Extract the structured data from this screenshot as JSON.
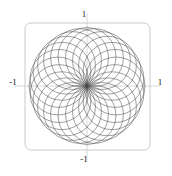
{
  "figure": {
    "name": "rose-circle-family-plot",
    "background_color": "#ffffff",
    "frame": {
      "color": "#bdbdbd",
      "stroke_width": 0.8,
      "corner_radius": 6,
      "x": 25,
      "y": 23,
      "width": 125,
      "height": 127
    },
    "axes": {
      "color": "#c9c9c9",
      "stroke_width": 0.7,
      "origin_px": {
        "x": 87,
        "y": 86
      },
      "x_axis_y_px": 86,
      "y_axis_x_px": 87
    },
    "curve": {
      "color": "#4a4a4a",
      "stroke_width": 0.55,
      "opacity": 0.95
    }
  },
  "ticks": {
    "top": "1",
    "bottom": "-1",
    "left": "-1",
    "right": "1"
  },
  "chart_data": {
    "type": "line",
    "title": "",
    "subtitle": "",
    "xlabel": "",
    "ylabel": "",
    "grid": false,
    "legend": "none",
    "xlim": [
      -1.08,
      1.08
    ],
    "ylim": [
      -1.08,
      1.08
    ],
    "xticks": [
      -1,
      1
    ],
    "yticks": [
      -1,
      1
    ],
    "xtick_labels": [
      "-1",
      "1"
    ],
    "ytick_labels": [
      "-1",
      "1"
    ],
    "aspect_ratio": 1,
    "parametric": {
      "family_count": 24,
      "circle_radius": 0.5,
      "center_orbit_radius": 0.5,
      "angle_step_deg": 15,
      "formula_x": "0.5*cos(k*15deg) + 0.5*cos(t)",
      "formula_y": "0.5*sin(k*15deg) + 0.5*sin(t)",
      "t_range_deg": [
        0,
        360
      ],
      "k_range": [
        0,
        23
      ]
    },
    "series": [
      {
        "name": "circle-00",
        "center_angle_deg": 0,
        "center": [
          0.5,
          0.0
        ],
        "radius": 0.5
      },
      {
        "name": "circle-01",
        "center_angle_deg": 15,
        "center": [
          0.483,
          0.129
        ],
        "radius": 0.5
      },
      {
        "name": "circle-02",
        "center_angle_deg": 30,
        "center": [
          0.433,
          0.25
        ],
        "radius": 0.5
      },
      {
        "name": "circle-03",
        "center_angle_deg": 45,
        "center": [
          0.354,
          0.354
        ],
        "radius": 0.5
      },
      {
        "name": "circle-04",
        "center_angle_deg": 60,
        "center": [
          0.25,
          0.433
        ],
        "radius": 0.5
      },
      {
        "name": "circle-05",
        "center_angle_deg": 75,
        "center": [
          0.129,
          0.483
        ],
        "radius": 0.5
      },
      {
        "name": "circle-06",
        "center_angle_deg": 90,
        "center": [
          0.0,
          0.5
        ],
        "radius": 0.5
      },
      {
        "name": "circle-07",
        "center_angle_deg": 105,
        "center": [
          -0.129,
          0.483
        ],
        "radius": 0.5
      },
      {
        "name": "circle-08",
        "center_angle_deg": 120,
        "center": [
          -0.25,
          0.433
        ],
        "radius": 0.5
      },
      {
        "name": "circle-09",
        "center_angle_deg": 135,
        "center": [
          -0.354,
          0.354
        ],
        "radius": 0.5
      },
      {
        "name": "circle-10",
        "center_angle_deg": 150,
        "center": [
          -0.433,
          0.25
        ],
        "radius": 0.5
      },
      {
        "name": "circle-11",
        "center_angle_deg": 165,
        "center": [
          -0.483,
          0.129
        ],
        "radius": 0.5
      },
      {
        "name": "circle-12",
        "center_angle_deg": 180,
        "center": [
          -0.5,
          0.0
        ],
        "radius": 0.5
      },
      {
        "name": "circle-13",
        "center_angle_deg": 195,
        "center": [
          -0.483,
          -0.129
        ],
        "radius": 0.5
      },
      {
        "name": "circle-14",
        "center_angle_deg": 210,
        "center": [
          -0.433,
          -0.25
        ],
        "radius": 0.5
      },
      {
        "name": "circle-15",
        "center_angle_deg": 225,
        "center": [
          -0.354,
          -0.354
        ],
        "radius": 0.5
      },
      {
        "name": "circle-16",
        "center_angle_deg": 240,
        "center": [
          -0.25,
          -0.433
        ],
        "radius": 0.5
      },
      {
        "name": "circle-17",
        "center_angle_deg": 255,
        "center": [
          -0.129,
          -0.483
        ],
        "radius": 0.5
      },
      {
        "name": "circle-18",
        "center_angle_deg": 270,
        "center": [
          0.0,
          -0.5
        ],
        "radius": 0.5
      },
      {
        "name": "circle-19",
        "center_angle_deg": 285,
        "center": [
          0.129,
          -0.483
        ],
        "radius": 0.5
      },
      {
        "name": "circle-20",
        "center_angle_deg": 300,
        "center": [
          0.25,
          -0.433
        ],
        "radius": 0.5
      },
      {
        "name": "circle-21",
        "center_angle_deg": 315,
        "center": [
          0.354,
          -0.354
        ],
        "radius": 0.5
      },
      {
        "name": "circle-22",
        "center_angle_deg": 330,
        "center": [
          0.433,
          -0.25
        ],
        "radius": 0.5
      },
      {
        "name": "circle-23",
        "center_angle_deg": 345,
        "center": [
          0.483,
          -0.129
        ],
        "radius": 0.5
      }
    ]
  }
}
